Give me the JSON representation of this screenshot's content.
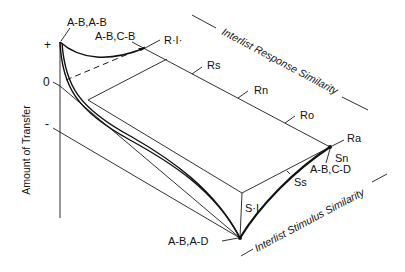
{
  "figure": {
    "y_axis": {
      "label": "Amount of Transfer",
      "ticks": {
        "plus": "+",
        "zero": "0",
        "minus": "-"
      }
    },
    "axes": {
      "response": "Interlist Response Similarity",
      "stimulus": "Interlist Stimulus Similarity"
    },
    "response_points": {
      "ri": "R·I·",
      "rs": "Rs",
      "rn": "Rn",
      "ro": "Ro",
      "ra": "Ra"
    },
    "stimulus_points": {
      "si": "S·I·",
      "ss": "Ss",
      "sn": "Sn"
    },
    "paradigms": {
      "ab_ab": "A-B,A-B",
      "ab_cb": "A-B,C-B",
      "ab_ad": "A-B,A-D",
      "ab_cd": "A-B,C-D"
    }
  }
}
